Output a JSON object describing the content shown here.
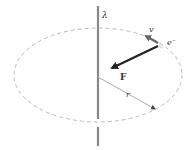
{
  "diagram": {
    "labels": {
      "lambda": "λ",
      "velocity": "v",
      "electron": "e⁻",
      "force": "F",
      "radius": "r"
    },
    "colors": {
      "wire": "#888888",
      "orbit": "#bbbbbb",
      "force_arrow": "#222222",
      "velocity_arrow": "#666666",
      "radius_line": "#aaaaaa",
      "text": "#333333"
    }
  }
}
